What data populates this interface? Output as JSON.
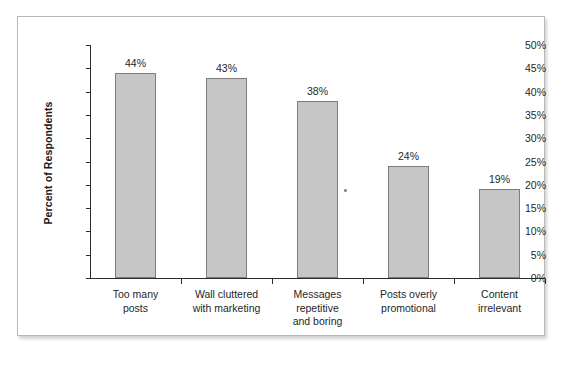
{
  "chart_data": {
    "type": "bar",
    "title": "",
    "xlabel": "",
    "ylabel": "Percent of Respondents",
    "categories": [
      "Too many posts",
      "Wall cluttered with marketing",
      "Messages repetitive and boring",
      "Posts overly promotional",
      "Content irrelevant"
    ],
    "category_lines": [
      [
        "Too many",
        "posts"
      ],
      [
        "Wall cluttered",
        "with marketing"
      ],
      [
        "Messages",
        "repetitive",
        "and boring"
      ],
      [
        "Posts overly",
        "promotional"
      ],
      [
        "Content",
        "irrelevant"
      ]
    ],
    "values": [
      44,
      43,
      38,
      24,
      19
    ],
    "data_labels": [
      "44%",
      "43%",
      "38%",
      "24%",
      "19%"
    ],
    "ylim": [
      0,
      50
    ],
    "ytick_values": [
      50,
      45,
      40,
      35,
      30,
      25,
      20,
      15,
      10,
      5,
      0
    ],
    "ytick_labels": [
      "50%",
      "45%",
      "40%",
      "35%",
      "30%",
      "25%",
      "20%",
      "15%",
      "10%",
      "5%",
      "0%"
    ],
    "grid": false,
    "legend": false,
    "bar_color": "#c6c6c6",
    "bar_border_color": "#7d7d7d",
    "axis_color": "#2b2b2b",
    "plot_background": "#ffffff"
  }
}
